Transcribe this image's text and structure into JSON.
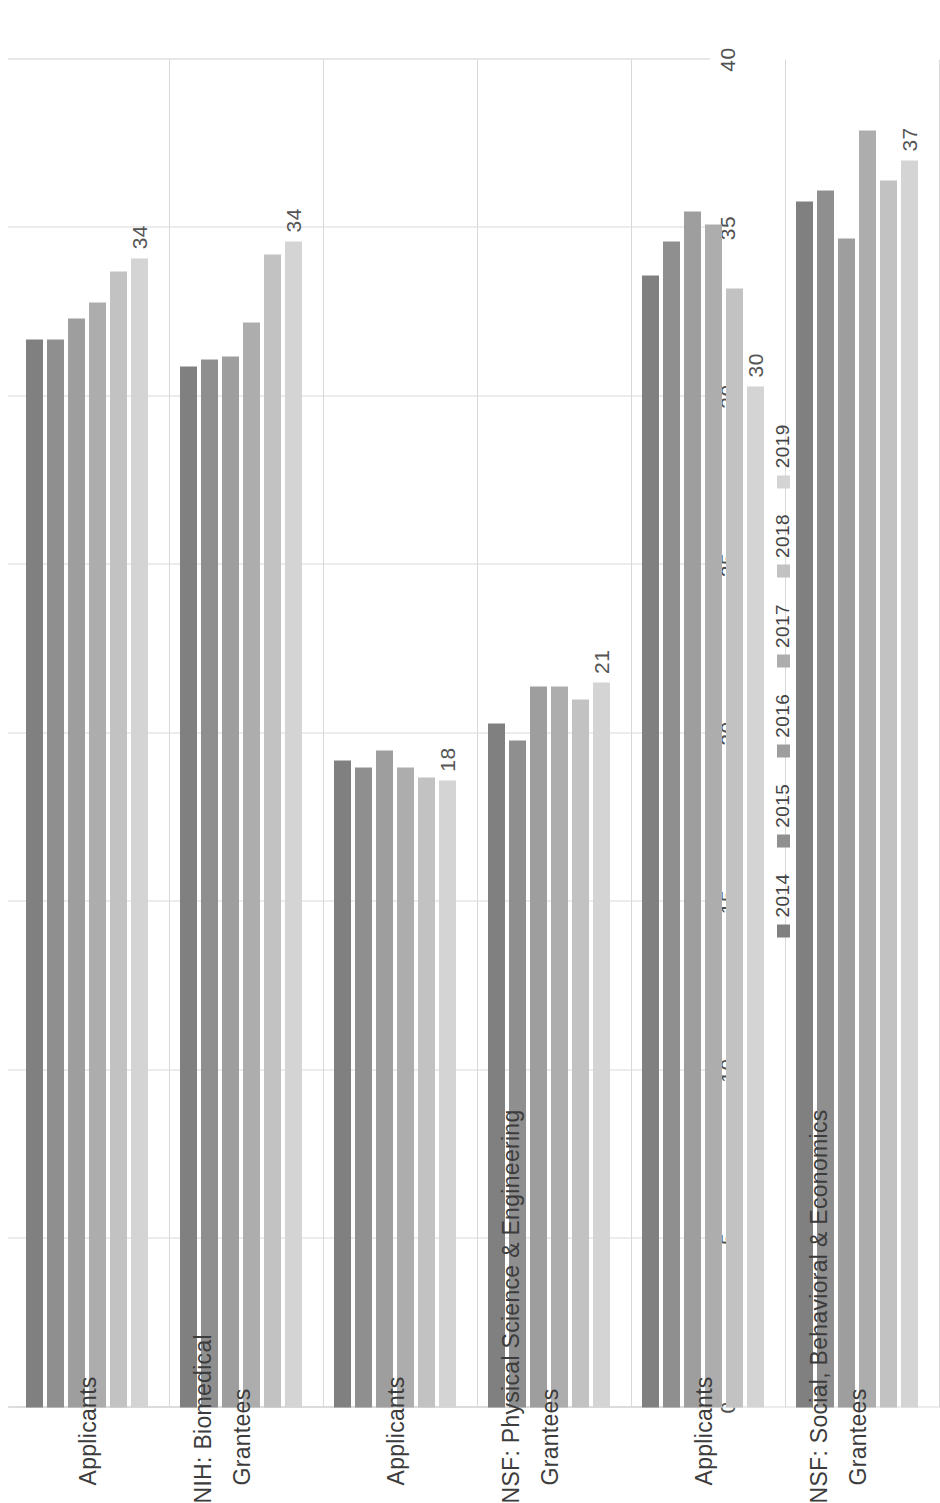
{
  "chart_data": {
    "type": "bar",
    "orientation": "horizontal",
    "title": "",
    "xlabel": "",
    "ylabel": "",
    "xlim": [
      0,
      40
    ],
    "xticks": [
      "0",
      "5",
      "10",
      "15",
      "20",
      "25",
      "30",
      "35",
      "40"
    ],
    "grid": true,
    "legend_position": "bottom",
    "legend": [
      "2014",
      "2015",
      "2016",
      "2017",
      "2018",
      "2019"
    ],
    "series_colors": [
      "#808080",
      "#8f8f8f",
      "#9e9e9e",
      "#adadad",
      "#c2c2c2",
      "#d4d4d4"
    ],
    "groups": [
      {
        "group_label": "NIH: Biomedical",
        "categories": [
          {
            "label": "Applicants",
            "values": [
              31.7,
              31.7,
              32.3,
              32.8,
              33.7,
              34.1
            ],
            "data_label": "34",
            "data_label_series": "2019"
          },
          {
            "label": "Grantees",
            "values": [
              30.9,
              31.1,
              31.2,
              32.2,
              34.2,
              34.6
            ],
            "data_label": "34",
            "data_label_series": "2019"
          }
        ]
      },
      {
        "group_label": "NSF: Physical Science & Engineering",
        "categories": [
          {
            "label": "Applicants",
            "values": [
              19.2,
              19.0,
              19.5,
              19.0,
              18.7,
              18.6
            ],
            "data_label": "18",
            "data_label_series": "2019"
          },
          {
            "label": "Grantees",
            "values": [
              20.3,
              19.8,
              21.4,
              21.4,
              21.0,
              21.5
            ],
            "data_label": "21",
            "data_label_series": "2019"
          }
        ]
      },
      {
        "group_label": "NSF: Social, Behavioral & Economics",
        "categories": [
          {
            "label": "Applicants",
            "values": [
              33.6,
              34.6,
              35.5,
              35.1,
              33.2,
              30.3
            ],
            "data_label": "30",
            "data_label_series": "2019"
          },
          {
            "label": "Grantees",
            "values": [
              35.8,
              36.1,
              34.7,
              37.9,
              36.4,
              37.0
            ],
            "data_label": "37",
            "data_label_series": "2019"
          }
        ]
      }
    ]
  }
}
